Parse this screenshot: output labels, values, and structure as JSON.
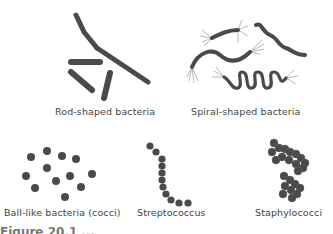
{
  "figure": {
    "panels": [
      {
        "id": "rod",
        "label": "Rod-shaped bacteria"
      },
      {
        "id": "spiral",
        "label": "Spiral-shaped bacteria"
      },
      {
        "id": "cocci",
        "label": "Ball-like bacteria (cocci)"
      },
      {
        "id": "strepto",
        "label": "Streptococcus"
      },
      {
        "id": "staph",
        "label": "Staphylococci"
      }
    ],
    "caption": "Figure 20.1 ..."
  },
  "colors": {
    "cell": "#4a4a4a",
    "flagella": "#999999",
    "text": "#444444"
  }
}
